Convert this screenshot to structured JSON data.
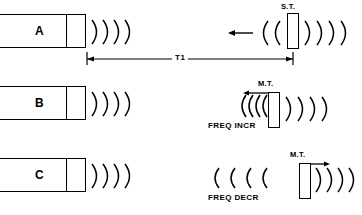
{
  "figure": {
    "background_color": "#ffffff",
    "stroke_color": "#000000"
  },
  "rows": [
    {
      "id": "row-a",
      "transmitter_label": "A",
      "target_label": "S.T.",
      "target_type": "stationary target",
      "emitted_wave_arcs": 4,
      "returning_wave_arcs": 2,
      "returning_wave_spacing": "normal",
      "transmitted_past_target_arcs": 4,
      "motion_arrow": "left",
      "motion_arrow_icon": "arrow-left-icon",
      "frequency_note": "",
      "dimension_label": "T1"
    },
    {
      "id": "row-b",
      "transmitter_label": "B",
      "target_label": "M.T.",
      "target_type": "moving target approaching",
      "emitted_wave_arcs": 4,
      "returning_wave_arcs": 4,
      "returning_wave_spacing": "compressed",
      "transmitted_past_target_arcs": 4,
      "motion_arrow": "left",
      "motion_arrow_icon": "arrow-left-icon",
      "frequency_note": "FREQ INCR",
      "dimension_label": ""
    },
    {
      "id": "row-c",
      "transmitter_label": "C",
      "target_label": "M.T.",
      "target_type": "moving target receding",
      "emitted_wave_arcs": 4,
      "returning_wave_arcs": 4,
      "returning_wave_spacing": "stretched",
      "transmitted_past_target_arcs": 4,
      "motion_arrow": "right",
      "motion_arrow_icon": "arrow-right-icon",
      "frequency_note": "FREQ DECR",
      "dimension_label": ""
    }
  ]
}
